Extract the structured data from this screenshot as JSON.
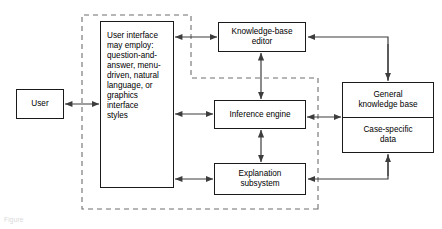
{
  "diagram": {
    "nodes": {
      "user": {
        "label": "User"
      },
      "user_interface": {
        "lines": [
          "User interface\nmay employ:",
          "question-and-\nanswer,",
          "menu-driven,",
          "natural\nlanguage, or",
          "graphics\ninterface\nstyles"
        ],
        "line1": "User interface\nmay employ:",
        "line2": "question-and-\nanswer,",
        "line3": "menu-driven,",
        "line4": "natural\nlanguage, or",
        "line5": "graphics\ninterface\nstyles"
      },
      "knowledge_base_editor": {
        "label": "Knowledge-base\neditor"
      },
      "inference_engine": {
        "label": "Inference engine"
      },
      "explanation_subsystem": {
        "label": "Explanation\nsubsystem"
      },
      "general_knowledge_base": {
        "label": "General\nknowledge base"
      },
      "case_specific_data": {
        "label": "Case-specific\ndata"
      }
    },
    "caption": "Figure",
    "colors": {
      "stroke": "#1a1a1a",
      "arrow": "#3d3d3d",
      "dashed": "#6e6e6e",
      "background": "#ffffff"
    },
    "edges": [
      {
        "from": "user",
        "to": "user_interface",
        "style": "double-arrow"
      },
      {
        "from": "user_interface",
        "to": "knowledge_base_editor",
        "style": "double-arrow"
      },
      {
        "from": "user_interface",
        "to": "inference_engine",
        "style": "double-arrow"
      },
      {
        "from": "user_interface",
        "to": "explanation_subsystem",
        "style": "double-arrow"
      },
      {
        "from": "knowledge_base_editor",
        "to": "inference_engine",
        "style": "double-arrow"
      },
      {
        "from": "inference_engine",
        "to": "explanation_subsystem",
        "style": "double-arrow"
      },
      {
        "from": "inference_engine",
        "to": "general_knowledge_base",
        "style": "double-arrow"
      },
      {
        "from": "general_knowledge_base",
        "to": "knowledge_base_editor",
        "style": "single-arrow"
      },
      {
        "from": "case_specific_data",
        "to": "explanation_subsystem",
        "style": "single-arrow"
      }
    ]
  }
}
